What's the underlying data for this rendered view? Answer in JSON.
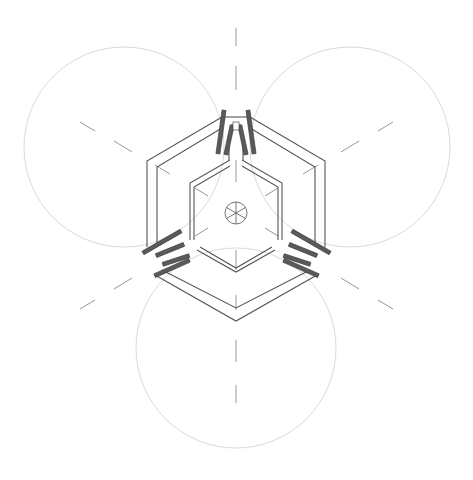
{
  "diagram": {
    "type": "architectural-plan",
    "colors": {
      "background": "#ffffff",
      "wall_line": "#555555",
      "circle_line": "#c8c8c8",
      "axis_line": "#888888",
      "door_fill": "#5a5a5a"
    },
    "center": [
      236,
      213
    ],
    "circles": [
      {
        "name": "circle-top-left",
        "cx": 124,
        "cy": 147,
        "r": 100
      },
      {
        "name": "circle-top-right",
        "cx": 350,
        "cy": 147,
        "r": 100
      },
      {
        "name": "circle-bottom",
        "cx": 236,
        "cy": 348,
        "r": 100
      }
    ],
    "door_sets": [
      {
        "name": "door-set-top",
        "angle": 0
      },
      {
        "name": "door-set-bottom-right",
        "angle": 120
      },
      {
        "name": "door-set-bottom-left",
        "angle": 240
      }
    ],
    "center_symbol": "wheel-spoked-circle"
  }
}
